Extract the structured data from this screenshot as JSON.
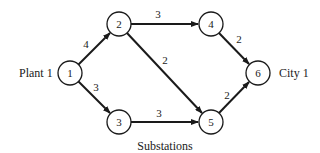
{
  "diagram": {
    "type": "directed-network",
    "labels": {
      "source": "Plant 1",
      "sink": "City 1",
      "middle": "Substations"
    },
    "nodes": [
      {
        "id": "1",
        "label": "1",
        "x": 70,
        "y": 73
      },
      {
        "id": "2",
        "label": "2",
        "x": 119,
        "y": 24
      },
      {
        "id": "3",
        "label": "3",
        "x": 119,
        "y": 122
      },
      {
        "id": "4",
        "label": "4",
        "x": 211,
        "y": 24
      },
      {
        "id": "5",
        "label": "5",
        "x": 211,
        "y": 122
      },
      {
        "id": "6",
        "label": "6",
        "x": 258,
        "y": 73
      }
    ],
    "edges": [
      {
        "from": "1",
        "to": "2",
        "weight": "4"
      },
      {
        "from": "1",
        "to": "3",
        "weight": "3"
      },
      {
        "from": "2",
        "to": "4",
        "weight": "3"
      },
      {
        "from": "2",
        "to": "5",
        "weight": "2"
      },
      {
        "from": "3",
        "to": "5",
        "weight": "3"
      },
      {
        "from": "4",
        "to": "6",
        "weight": "2"
      },
      {
        "from": "5",
        "to": "6",
        "weight": "2"
      }
    ]
  }
}
